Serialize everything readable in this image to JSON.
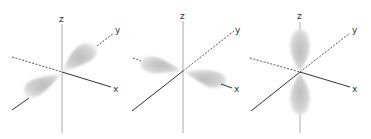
{
  "figure": {
    "panels": [
      {
        "name": "py-orbital",
        "orientation": "y",
        "labels": {
          "z": "z",
          "y": "y",
          "x": "x"
        }
      },
      {
        "name": "px-orbital",
        "orientation": "x",
        "labels": {
          "z": "z",
          "y": "y",
          "x": "x"
        }
      },
      {
        "name": "pz-orbital",
        "orientation": "z",
        "labels": {
          "z": "z",
          "y": "y",
          "x": "x"
        }
      }
    ]
  },
  "colors": {
    "background": "#ffffff",
    "axis_solid": "#333333",
    "axis_z": "#aaaaaa",
    "axis_dashed": "#444444",
    "lobe_core": "#bdbdbd",
    "lobe_edge": "#e8e8e8",
    "label": "#333333"
  }
}
